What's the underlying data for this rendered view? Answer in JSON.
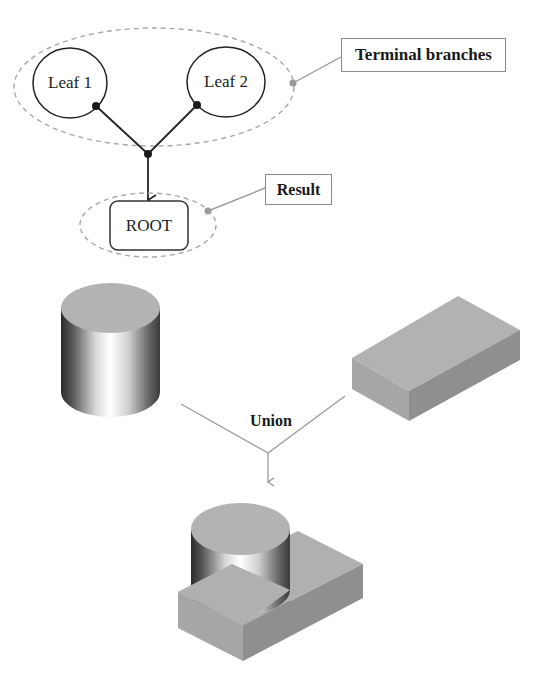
{
  "tree_diagram": {
    "leaves": [
      {
        "label": "Leaf 1"
      },
      {
        "label": "Leaf 2"
      }
    ],
    "root": {
      "label": "ROOT"
    },
    "callouts": {
      "terminal_branches": "Terminal branches",
      "result": "Result"
    }
  },
  "csg_diagram": {
    "inputs": [
      "Cylinder",
      "Box"
    ],
    "operation": "Union",
    "output": "Cylinder ∪ Box"
  },
  "colors": {
    "stroke_dark": "#222222",
    "dashed_gray": "#a8a8a8",
    "callout_gray": "#9a9a9a",
    "solid_face": "#a9a9a9",
    "solid_face_dark": "#8e8e8e",
    "solid_top": "#b5b5b5"
  }
}
